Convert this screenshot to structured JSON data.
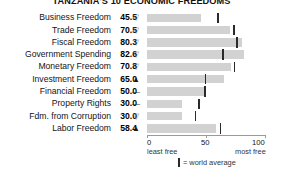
{
  "chart_data": {
    "type": "bar",
    "title": "TANZANIA'S 10 ECONOMIC FREEDOMS",
    "xlabel": "",
    "ylabel": "",
    "xlim": [
      0,
      100
    ],
    "grid": false,
    "legend_position": "bottom-center",
    "categories": [
      "Business Freedom",
      "Trade Freedom",
      "Fiscal Freedom",
      "Government Spending",
      "Monetary Freedom",
      "Investment Freedom",
      "Financial Freedom",
      "Property Rights",
      "Fdm. from Corruption",
      "Labor Freedom"
    ],
    "values": [
      45.5,
      70.5,
      80.3,
      82.6,
      70.8,
      65.0,
      50.0,
      30.0,
      30.0,
      58.4
    ],
    "value_labels": [
      "45.5",
      "70.5",
      "80.3",
      "82.6",
      "70.8",
      "65.0",
      "50.0",
      "30.0",
      "30.0",
      "58.4"
    ],
    "trends": [
      "down",
      "down",
      "down",
      "down",
      "down",
      "up",
      "flat",
      "flat",
      "down",
      "up"
    ],
    "trend_glyphs": [
      "▽",
      "▽",
      "▽",
      "▽",
      "▽",
      "▲",
      "—",
      "—",
      "▽",
      "▲"
    ],
    "world_average": [
      59.3,
      73.0,
      75.4,
      63.8,
      73.4,
      49.0,
      48.5,
      43.6,
      40.5,
      61.5
    ],
    "series": [
      {
        "name": "Tanzania score",
        "values": [
          45.5,
          70.5,
          80.3,
          82.6,
          70.8,
          65.0,
          50.0,
          30.0,
          30.0,
          58.4
        ]
      },
      {
        "name": "world average",
        "values": [
          59.3,
          73.0,
          75.4,
          63.8,
          73.4,
          49.0,
          48.5,
          43.6,
          40.5,
          61.5
        ]
      }
    ],
    "axis_ticks": [
      {
        "value": 0,
        "label": "0",
        "sublabel": "least free"
      },
      {
        "value": 50,
        "label": "50",
        "sublabel": ""
      },
      {
        "value": 100,
        "label": "100",
        "sublabel": "most free"
      }
    ],
    "legend": [
      {
        "marker": "tick",
        "label": "= world average"
      }
    ],
    "colors": {
      "bar": "#d2d2d2",
      "average_tick": "#2a2a2a",
      "axis": "#9a9a9a",
      "text": "#141414",
      "trend_down": "#8e8e8e",
      "trend_up": "#1a1a1a"
    }
  }
}
